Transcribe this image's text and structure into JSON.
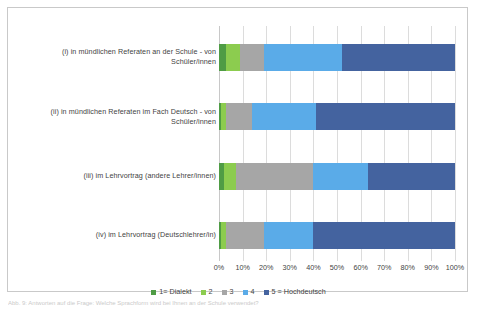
{
  "chart_data": {
    "type": "bar",
    "orientation": "horizontal",
    "stacked": true,
    "stack_mode": "percent",
    "title": "",
    "subtitle": "",
    "xlabel": "",
    "ylabel": "",
    "xlim": [
      0,
      100
    ],
    "grid": true,
    "legend_position": "bottom",
    "xticks": [
      "0%",
      "10%",
      "20%",
      "30%",
      "40%",
      "50%",
      "60%",
      "70%",
      "80%",
      "90%",
      "100%"
    ],
    "xtick_values": [
      0,
      10,
      20,
      30,
      40,
      50,
      60,
      70,
      80,
      90,
      100
    ],
    "categories": [
      "(i) in mündlichen Referaten an der Schule - von Schüler/innen",
      "(ii) in mündlichen Referaten im Fach Deutsch - von Schüler/innen",
      "(iii) im Lehrvortrag (andere Lehrer/innen)",
      "(iv) im Lehrvortrag (Deutschlehrer/in)"
    ],
    "series": [
      {
        "name": "1= Dialekt",
        "color": "#4f9c45",
        "values": [
          3,
          1,
          2,
          1
        ]
      },
      {
        "name": "2",
        "color": "#8ccc4f",
        "values": [
          6,
          2,
          5,
          2
        ]
      },
      {
        "name": "3",
        "color": "#a6a6a6",
        "values": [
          10,
          11,
          33,
          16
        ]
      },
      {
        "name": "4",
        "color": "#5aabe8",
        "values": [
          33,
          27,
          23,
          21
        ]
      },
      {
        "name": "5 = Hochdeutsch",
        "color": "#44639f",
        "values": [
          48,
          59,
          37,
          60
        ]
      }
    ]
  },
  "legend": {
    "items": [
      {
        "label": "1= Dialekt",
        "color": "#4f9c45"
      },
      {
        "label": "2",
        "color": "#8ccc4f"
      },
      {
        "label": "3",
        "color": "#a6a6a6"
      },
      {
        "label": "4",
        "color": "#5aabe8"
      },
      {
        "label": "5 = Hochdeutsch",
        "color": "#44639f"
      }
    ]
  },
  "caption": {
    "text": "Abb. 9: Antworten auf die Frage: Welche Sprachform wird bei Ihnen an der Schule verwendet?"
  }
}
